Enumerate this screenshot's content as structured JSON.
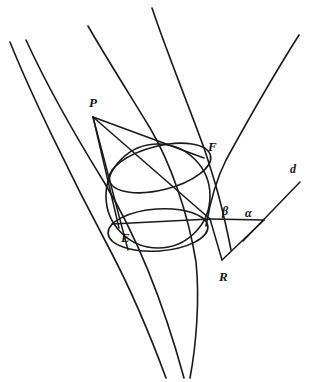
{
  "figure": {
    "kind": "geometry-diagram",
    "background_color": "#ffffff",
    "ink_color": "#1a1a1a"
  },
  "labels": {
    "point_p": "P",
    "point_f": "F",
    "point_e": "E",
    "point_r": "R",
    "line_d": "d",
    "angle_beta": "β",
    "angle_alpha": "α"
  },
  "points": {
    "P": {
      "x": 93,
      "y": 117,
      "label_x": 91,
      "label_y": 98
    },
    "F": {
      "x": 203,
      "y": 157,
      "label_x": 209,
      "label_y": 141
    },
    "E": {
      "x": 120,
      "y": 228,
      "label_x": 122,
      "label_y": 231
    },
    "R": {
      "x": 222,
      "y": 262,
      "label_x": 221,
      "label_y": 271
    },
    "T_right": {
      "x": 210,
      "y": 219
    },
    "V_alpha": {
      "x": 263,
      "y": 220
    },
    "D_top": {
      "x": 300,
      "y": 182
    },
    "cross_bottom": {
      "x": 165,
      "y": 330
    }
  },
  "sphere": {
    "center_x": 158,
    "center_y": 196,
    "radius": 52,
    "upper_ellipse": {
      "cx": 160,
      "cy": 168,
      "rx": 52,
      "ry": 22,
      "rotate": -14
    },
    "lower_ellipse": {
      "cx": 160,
      "cy": 230,
      "rx": 50,
      "ry": 21,
      "rotate": -5
    }
  },
  "angle_marks": {
    "beta": {
      "x": 226,
      "y": 213
    },
    "alpha": {
      "x": 249,
      "y": 214
    }
  },
  "cone_generators": [
    {
      "name": "generator-left-outer",
      "from_x": 10,
      "from_y": 42,
      "to_x": 175,
      "to_y": 382
    },
    {
      "name": "generator-left-inner",
      "from_x": 26,
      "from_y": 40,
      "to_x": 190,
      "to_y": 382
    },
    {
      "name": "generator-middle",
      "from_x": 88,
      "from_y": 26,
      "to_x": 197,
      "to_y": 382
    },
    {
      "name": "generator-right",
      "from_x": 152,
      "from_y": 8,
      "to_x": 232,
      "to_y": 251
    },
    {
      "name": "generator-far-right",
      "from_x": 299,
      "from_y": 35,
      "to_x": 206,
      "to_y": 228
    }
  ],
  "tangent_lines": [
    {
      "name": "tangent-P-to-F",
      "from": "P",
      "to": "F"
    },
    {
      "name": "tangent-P-to-E",
      "from": "P",
      "to": "E"
    },
    {
      "name": "tangent-P-to-T",
      "from": "P",
      "to": "T_right"
    }
  ],
  "segments": [
    {
      "name": "segment-E-to-T",
      "label": "chord E T"
    },
    {
      "name": "segment-T-to-V",
      "label": "directrix segment"
    },
    {
      "name": "segment-T-to-R",
      "label": "segment T R"
    },
    {
      "name": "segment-R-to-V",
      "label": "segment R V"
    }
  ],
  "stroke_widths": {
    "cone": 1.6,
    "sphere": 1.6,
    "tangent": 1.4,
    "segment": 1.4
  }
}
